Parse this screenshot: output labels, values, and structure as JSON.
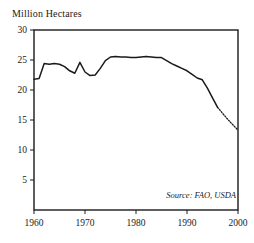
{
  "chart_data": {
    "type": "line",
    "title": "",
    "ylabel": "Million Hectares",
    "xlabel": "",
    "xlim": [
      1960,
      2000
    ],
    "ylim": [
      0,
      30
    ],
    "grid": false,
    "legend": false,
    "annotations": [
      {
        "name": "source-note",
        "text": "Source: FAO, USDA",
        "position": "bottom-right-inside-plot",
        "style": "italic"
      }
    ],
    "ytick_labels": [
      "5",
      "10",
      "15",
      "20",
      "25",
      "30"
    ],
    "ytick_values": [
      5,
      10,
      15,
      20,
      25,
      30
    ],
    "xtick_labels": [
      "1960",
      "1970",
      "1980",
      "1990",
      "2000"
    ],
    "xtick_values": [
      1960,
      1970,
      1980,
      1990,
      2000
    ],
    "x": [
      1960,
      1961,
      1962,
      1963,
      1964,
      1965,
      1966,
      1967,
      1968,
      1969,
      1970,
      1971,
      1972,
      1973,
      1974,
      1975,
      1976,
      1977,
      1978,
      1979,
      1980,
      1981,
      1982,
      1983,
      1984,
      1985,
      1986,
      1987,
      1988,
      1989,
      1990,
      1991,
      1992,
      1993,
      1994,
      1995,
      1996,
      1997,
      1998,
      1999,
      2000
    ],
    "series": [
      {
        "name": "Grain harvested area",
        "style": "solid",
        "values": [
          21.8,
          21.9,
          24.4,
          24.3,
          24.4,
          24.3,
          23.9,
          23.2,
          22.8,
          24.6,
          23.0,
          22.4,
          22.5,
          23.6,
          24.9,
          25.5,
          25.6,
          25.5,
          25.5,
          25.4,
          25.4,
          25.5,
          25.6,
          25.5,
          25.4,
          25.4,
          24.9,
          24.4,
          24.0,
          23.6,
          23.2,
          22.6,
          22.0,
          21.7,
          20.3,
          18.7,
          17.1,
          null,
          null,
          null,
          null
        ]
      },
      {
        "name": "Projected",
        "style": "dotted",
        "values": [
          null,
          null,
          null,
          null,
          null,
          null,
          null,
          null,
          null,
          null,
          null,
          null,
          null,
          null,
          null,
          null,
          null,
          null,
          null,
          null,
          null,
          null,
          null,
          null,
          null,
          null,
          null,
          null,
          null,
          null,
          null,
          null,
          null,
          null,
          null,
          null,
          17.1,
          16.1,
          15.1,
          14.2,
          13.3
        ]
      }
    ]
  },
  "figure": {
    "axis_title": "Million Hectares",
    "source_note": "Source: FAO, USDA"
  }
}
